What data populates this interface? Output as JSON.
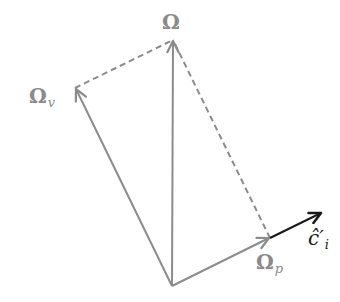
{
  "diagram": {
    "colors": {
      "vector_gray": "#8c8c8c",
      "label_gray": "#8a8a8a",
      "unit_vector": "#1a1a1a",
      "background": "#ffffff"
    },
    "origin": {
      "x": 172,
      "y": 286
    },
    "vectors": [
      {
        "id": "omega",
        "label": "Ω",
        "subscript": "",
        "tip": {
          "x": 173,
          "y": 40
        },
        "style": "solid",
        "color": "#8c8c8c"
      },
      {
        "id": "omega_v",
        "label": "Ω",
        "subscript": "v",
        "tip": {
          "x": 75,
          "y": 88
        },
        "style": "solid",
        "color": "#8c8c8c"
      },
      {
        "id": "omega_p",
        "label": "Ω",
        "subscript": "p",
        "tip": {
          "x": 270,
          "y": 238
        },
        "style": "solid",
        "color": "#8c8c8c"
      },
      {
        "id": "c_hat_prime_i",
        "label": "ĉ′",
        "subscript": "i",
        "from": {
          "x": 270,
          "y": 238
        },
        "tip": {
          "x": 322,
          "y": 213
        },
        "style": "solid",
        "color": "#1a1a1a"
      }
    ],
    "dashed_lines": [
      {
        "from": "omega_v",
        "to": "omega"
      },
      {
        "from": "omega_p",
        "to": "omega"
      }
    ],
    "labels": {
      "omega": {
        "text": "Ω",
        "sub": ""
      },
      "omega_v": {
        "text": "Ω",
        "sub": "v"
      },
      "omega_p": {
        "text": "Ω",
        "sub": "p"
      },
      "c_hat": {
        "text": "ĉ′",
        "sub": "i"
      }
    }
  }
}
